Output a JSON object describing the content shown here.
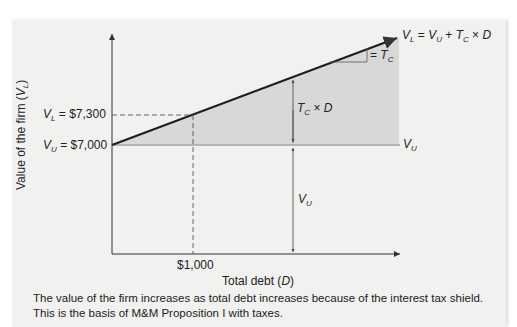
{
  "figure": {
    "y_axis_label_prefix": "Value of the firm (",
    "y_axis_label_var": "V",
    "y_axis_label_sub": "L",
    "y_axis_label_suffix": ")",
    "x_axis_label_prefix": "Total debt (",
    "x_axis_label_var": "D",
    "x_axis_label_suffix": ")",
    "y_tick_vl": {
      "var": "V",
      "sub": "L",
      "text": " = $7,300"
    },
    "y_tick_vu": {
      "var": "V",
      "sub": "U",
      "text": " = $7,000"
    },
    "x_tick": "$1,000",
    "line_label": {
      "v1": "V",
      "s1": "L",
      "eq": " = ",
      "v2": "V",
      "s2": "U",
      "plus": " + ",
      "v3": "T",
      "s3": "C",
      "times": " × ",
      "v4": "D"
    },
    "slope_label": {
      "eq": "= ",
      "var": "T",
      "sub": "C"
    },
    "shield_label": {
      "var": "T",
      "sub": "C",
      "times": " × ",
      "v2": "D"
    },
    "vu_right_label": {
      "var": "V",
      "sub": "U"
    },
    "vu_inner_label": {
      "var": "V",
      "sub": "U"
    },
    "caption_line1": "The value of the firm increases as total debt increases because of the interest tax shield.",
    "caption_line2": "This is the basis of M&M Proposition I with taxes.",
    "colors": {
      "panel_bg": "#f1f1f0",
      "shade": "#d8d8d8",
      "vu_line": "#b4b4b4",
      "vl_line": "#1e1e1e",
      "axis": "#333333"
    }
  }
}
